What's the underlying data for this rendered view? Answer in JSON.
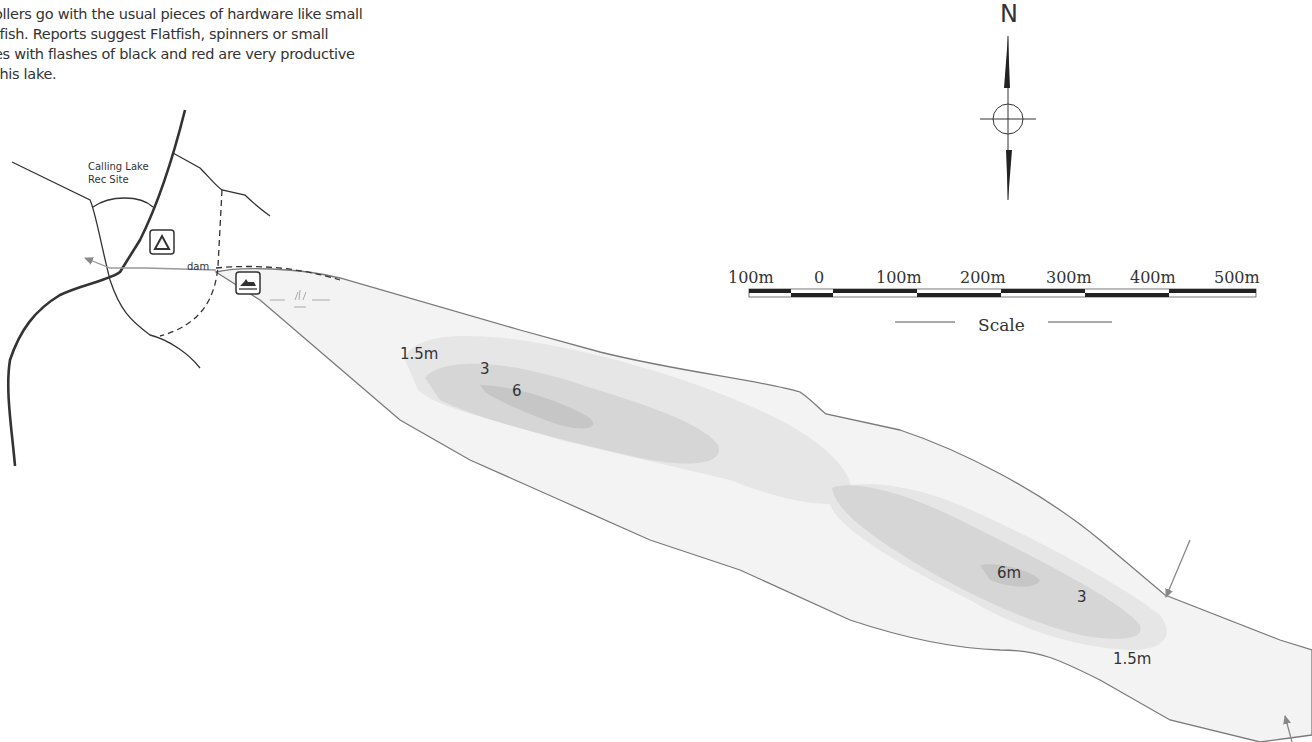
{
  "intro_text": {
    "lines": [
      "ollers go with the usual pieces of hardware like small",
      "tfish. Reports suggest Flatfish, spinners or small",
      "es with flashes of black and red are very productive",
      "this lake."
    ]
  },
  "map": {
    "rec_site_label_1": "Calling Lake",
    "rec_site_label_2": "Rec Site",
    "dam_label": "dam",
    "icons": [
      "campground-icon",
      "boat-launch-icon",
      "marsh-icon",
      "north-arrow-icon"
    ],
    "north_label": "N",
    "depth_labels": {
      "west_15": "1.5m",
      "west_3": "3",
      "west_6": "6",
      "east_6": "6m",
      "east_3": "3",
      "east_15": "1.5m"
    },
    "scale": {
      "ticks": [
        "100m",
        "0",
        "100m",
        "200m",
        "300m",
        "400m",
        "500m"
      ],
      "title": "Scale"
    },
    "colors": {
      "shore": "#7a7a7a",
      "depth_shallow": "#f0f0f0",
      "depth_15": "#e3e3e3",
      "depth_3": "#d3d3d3",
      "depth_6": "#c4c4c4",
      "road": "#333333"
    }
  }
}
